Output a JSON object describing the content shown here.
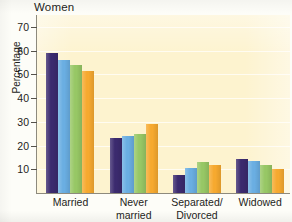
{
  "chart_data": {
    "type": "bar",
    "title": "Women",
    "xlabel": "",
    "ylabel": "Percentage",
    "ylim": [
      0,
      75
    ],
    "yticks": [
      10,
      20,
      30,
      40,
      50,
      60,
      70
    ],
    "grid": true,
    "legend_position": "none",
    "categories": [
      "Married",
      "Never married",
      "Separated/ Divorced",
      "Widowed"
    ],
    "category_lines": [
      [
        "Married"
      ],
      [
        "Never",
        "married"
      ],
      [
        "Separated/",
        "Divorced"
      ],
      [
        "Widowed"
      ]
    ],
    "series": [
      {
        "name": "Series 1",
        "color": "#3b2a6e",
        "values": [
          59,
          23,
          7.5,
          14.5
        ]
      },
      {
        "name": "Series 2",
        "color": "#6aaee2",
        "values": [
          56,
          24,
          10.5,
          13.5
        ]
      },
      {
        "name": "Series 3",
        "color": "#97c765",
        "values": [
          54,
          25,
          13,
          12
        ]
      },
      {
        "name": "Series 4",
        "color": "#f6a92f",
        "values": [
          51.5,
          29,
          12,
          10
        ]
      }
    ],
    "annotations": []
  },
  "colors": {
    "plot_background": "#fdf3cf",
    "page_background": "#fdfdf8",
    "axis": "#8d8a7d",
    "text": "#1d1d1b",
    "gridline": "#ffffff"
  }
}
